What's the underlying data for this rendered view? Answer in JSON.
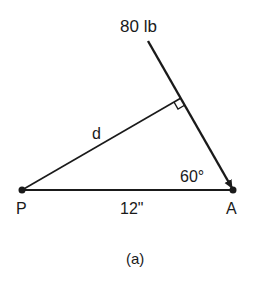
{
  "figure": {
    "caption": "(a)",
    "force_label": "80 lb",
    "distance_label": "d",
    "angle_label": "60°",
    "base_label": "12\"",
    "point_p": "P",
    "point_a": "A"
  },
  "colors": {
    "ink": "#1a1a1a",
    "background": "#ffffff"
  }
}
